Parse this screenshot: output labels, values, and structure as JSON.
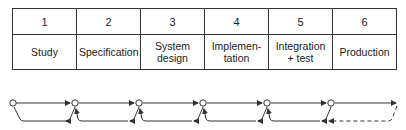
{
  "diagram": {
    "type": "waterfall-process",
    "phases": [
      {
        "number": "1",
        "name": "Study"
      },
      {
        "number": "2",
        "name": "Specification"
      },
      {
        "number": "3",
        "name": "System design"
      },
      {
        "number": "4",
        "name": "Implemen-tation"
      },
      {
        "number": "5",
        "name": "Integration + test"
      },
      {
        "number": "6",
        "name": "Production"
      }
    ],
    "flow": {
      "forward_arrows": 6,
      "feedback_arrows": 5,
      "last_feedback_style": "dashed"
    },
    "colors": {
      "line": "#333333",
      "background": "#ffffff"
    }
  }
}
